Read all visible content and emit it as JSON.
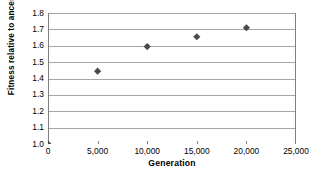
{
  "chart_data": {
    "type": "scatter",
    "title": "",
    "xlabel": "Generation",
    "ylabel": "Fitness relative to ancestor",
    "x": [
      0,
      5000,
      10000,
      15000,
      20000
    ],
    "values": [
      1.0,
      1.445,
      1.595,
      1.655,
      1.71
    ],
    "series": [
      {
        "name": "Fitness",
        "points": [
          {
            "x": 0,
            "y": 1.0
          },
          {
            "x": 5000,
            "y": 1.445
          },
          {
            "x": 10000,
            "y": 1.595
          },
          {
            "x": 15000,
            "y": 1.655
          },
          {
            "x": 20000,
            "y": 1.71
          }
        ]
      }
    ],
    "xlim": [
      0,
      25000
    ],
    "ylim": [
      1.0,
      1.8
    ],
    "xticks": [
      0,
      5000,
      10000,
      15000,
      20000,
      25000
    ],
    "yticks": [
      1.0,
      1.1,
      1.2,
      1.3,
      1.4,
      1.5,
      1.6,
      1.7,
      1.8
    ],
    "xtick_labels": [
      "0",
      "5,000",
      "10,000",
      "15,000",
      "20,000",
      "25,000"
    ],
    "ytick_labels": [
      "1.0",
      "1.1",
      "1.2",
      "1.3",
      "1.4",
      "1.5",
      "1.6",
      "1.7",
      "1.8"
    ],
    "grid": "horizontal",
    "legend": "none",
    "marker": "diamond",
    "marker_color": "#4a4a4a",
    "grid_color": "#a6a6a6",
    "axis_color": "#808080",
    "background": "#ffffff"
  }
}
